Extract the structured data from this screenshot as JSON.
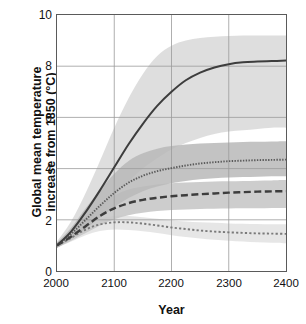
{
  "chart_data": {
    "type": "line",
    "title": "",
    "xlabel": "Year",
    "ylabel": "Global mean temperature\nincrease from 1850 (°C)",
    "xlim": [
      2000,
      2400
    ],
    "ylim": [
      0,
      10
    ],
    "xticks": [
      2000,
      2100,
      2200,
      2300,
      2400
    ],
    "yticks": [
      0,
      2,
      4,
      6,
      8,
      10
    ],
    "grid": true,
    "legend": "none",
    "x": [
      2000,
      2025,
      2050,
      2075,
      2100,
      2125,
      2150,
      2175,
      2200,
      2225,
      2250,
      2275,
      2300,
      2325,
      2350,
      2375,
      2400
    ],
    "series": [
      {
        "name": "highest-scenario",
        "style": "solid",
        "color": "#3d3d3d",
        "values": [
          1.0,
          1.55,
          2.3,
          3.15,
          4.05,
          4.95,
          5.75,
          6.45,
          7.0,
          7.45,
          7.75,
          7.95,
          8.08,
          8.15,
          8.18,
          8.2,
          8.22
        ],
        "band_upper": [
          1.15,
          1.95,
          3.05,
          4.3,
          5.6,
          6.75,
          7.7,
          8.4,
          8.8,
          9.0,
          9.1,
          9.15,
          9.18,
          9.2,
          9.2,
          9.2,
          9.2
        ],
        "band_lower": [
          0.9,
          1.3,
          1.8,
          2.35,
          2.95,
          3.5,
          4.0,
          4.4,
          4.75,
          5.0,
          5.2,
          5.35,
          5.45,
          5.5,
          5.55,
          5.6,
          5.6
        ],
        "band_color": "#d8d8d8"
      },
      {
        "name": "mid-high-scenario",
        "style": "fine-dotted",
        "color": "#5a5a5a",
        "values": [
          1.0,
          1.45,
          2.0,
          2.55,
          3.05,
          3.45,
          3.72,
          3.9,
          4.02,
          4.12,
          4.2,
          4.25,
          4.29,
          4.31,
          4.33,
          4.34,
          4.35
        ],
        "band_upper": [
          1.1,
          1.7,
          2.45,
          3.15,
          3.8,
          4.3,
          4.6,
          4.78,
          4.88,
          4.94,
          4.98,
          5.0,
          5.02,
          5.04,
          5.05,
          5.06,
          5.07
        ],
        "band_lower": [
          0.9,
          1.25,
          1.65,
          2.08,
          2.5,
          2.85,
          3.12,
          3.3,
          3.43,
          3.52,
          3.58,
          3.62,
          3.65,
          3.67,
          3.68,
          3.7,
          3.7
        ],
        "band_color": "#b8b8b8"
      },
      {
        "name": "mid-low-scenario",
        "style": "dashed",
        "color": "#3d3d3d",
        "values": [
          1.0,
          1.35,
          1.75,
          2.15,
          2.45,
          2.65,
          2.78,
          2.86,
          2.92,
          2.96,
          3.0,
          3.03,
          3.06,
          3.08,
          3.1,
          3.11,
          3.12
        ],
        "band_upper": [
          1.1,
          1.6,
          2.15,
          2.6,
          2.95,
          3.18,
          3.3,
          3.38,
          3.43,
          3.46,
          3.48,
          3.5,
          3.51,
          3.52,
          3.53,
          3.54,
          3.55
        ],
        "band_lower": [
          0.9,
          1.18,
          1.48,
          1.78,
          2.02,
          2.18,
          2.28,
          2.34,
          2.38,
          2.4,
          2.42,
          2.43,
          2.44,
          2.45,
          2.45,
          2.46,
          2.46
        ],
        "band_color": "#c4c4c4"
      },
      {
        "name": "lowest-scenario",
        "style": "coarse-dotted",
        "color": "#7a7a7a",
        "values": [
          1.0,
          1.3,
          1.62,
          1.82,
          1.9,
          1.9,
          1.85,
          1.78,
          1.7,
          1.64,
          1.58,
          1.54,
          1.51,
          1.49,
          1.47,
          1.46,
          1.45
        ],
        "band_upper": [
          1.08,
          1.45,
          1.82,
          2.05,
          2.15,
          2.15,
          2.1,
          2.04,
          1.98,
          1.93,
          1.9,
          1.88,
          1.86,
          1.85,
          1.84,
          1.83,
          1.83
        ],
        "band_lower": [
          0.92,
          1.15,
          1.4,
          1.56,
          1.62,
          1.6,
          1.55,
          1.48,
          1.4,
          1.33,
          1.27,
          1.22,
          1.18,
          1.15,
          1.12,
          1.1,
          1.08
        ],
        "band_color": "#e2e2e2"
      }
    ]
  },
  "axes": {
    "ylabel": "Global mean temperature\nincrease from 1850 (°C)",
    "xlabel": "Year",
    "ytick_labels": [
      "10",
      "8",
      "6",
      "4",
      "2",
      "0"
    ],
    "xtick_labels": [
      "2000",
      "2100",
      "2200",
      "2300",
      "2400"
    ]
  },
  "colors": {
    "frame": "#5a5a5a",
    "grid": "#9a9a9a",
    "text": "#111111"
  }
}
